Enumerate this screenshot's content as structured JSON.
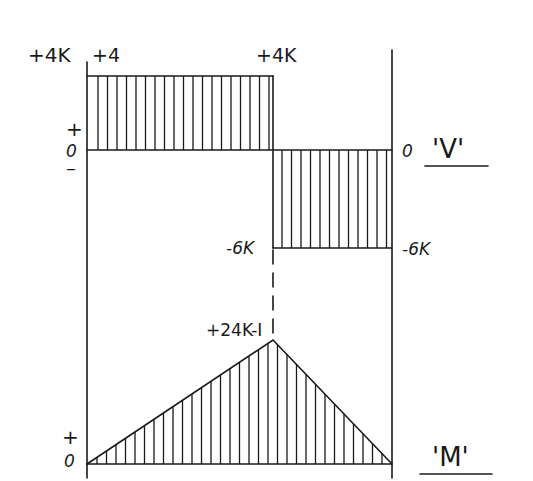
{
  "diagram": {
    "type": "shear-and-moment-diagram",
    "shear": {
      "label": "'V'",
      "sign_plus": "+",
      "sign_zero": "0",
      "sign_minus": "–",
      "left_top_label": "+4K",
      "left_inner_label": "+4",
      "mid_top_label": "+4K",
      "right_zero_label": "0",
      "mid_bottom_label": "-6K",
      "right_bottom_label": "-6K",
      "segments": [
        {
          "from": "left",
          "to": "mid",
          "value": 4,
          "unit": "K"
        },
        {
          "from": "mid",
          "to": "right",
          "value": -6,
          "unit": "K"
        }
      ]
    },
    "moment": {
      "label": "'M'",
      "sign_plus": "+",
      "sign_zero": "0",
      "peak_label": "+24K-I",
      "points": [
        {
          "position": "left",
          "value": 0
        },
        {
          "position": "mid",
          "value": 24,
          "unit": "K-I"
        },
        {
          "position": "right",
          "value": 0
        }
      ]
    }
  },
  "colors": {
    "ink": "#1a1a1a",
    "background": "#ffffff"
  }
}
